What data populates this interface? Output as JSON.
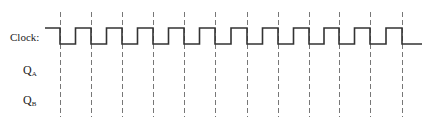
{
  "diagram": {
    "type": "timing-diagram",
    "signals": [
      {
        "id": "clock",
        "label": "Clock:",
        "subscript": ""
      },
      {
        "id": "qa",
        "label": "Q",
        "subscript": "A"
      },
      {
        "id": "qb",
        "label": "Q",
        "subscript": "B"
      }
    ],
    "clock": {
      "start_x": 45,
      "end_x": 422,
      "high_y": 28,
      "low_y": 44,
      "first_fall_x": 60,
      "period_px": 31.1,
      "cycles": 12,
      "initial_level": "high",
      "final_level": "low"
    },
    "dashed_lines": {
      "x_positions": [
        60,
        91,
        122,
        153,
        184,
        215,
        247,
        278,
        309,
        339,
        370,
        402
      ],
      "y_top": 12,
      "y_bottom": 117
    },
    "colors": {
      "waveform": "#333333",
      "dashed": "#777777",
      "text": "#222222"
    }
  }
}
